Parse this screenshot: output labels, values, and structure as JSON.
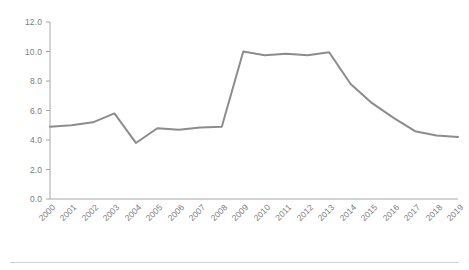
{
  "chart_data": {
    "type": "line",
    "title": "",
    "subtitle": "",
    "xlabel": "",
    "ylabel": "",
    "categories": [
      "2000",
      "2001",
      "2002",
      "2003",
      "2004",
      "2005",
      "2006",
      "2007",
      "2008",
      "2009",
      "2010",
      "2011",
      "2012",
      "2013",
      "2014",
      "2015",
      "2016",
      "2017",
      "2018",
      "2019"
    ],
    "series": [
      {
        "name": "",
        "values": [
          4.9,
          5.0,
          5.2,
          5.8,
          3.8,
          4.8,
          4.7,
          4.85,
          4.9,
          10.0,
          9.75,
          9.85,
          9.75,
          9.95,
          7.8,
          6.5,
          5.5,
          4.6,
          4.3,
          4.2
        ]
      }
    ],
    "ylim": [
      0.0,
      12.0
    ],
    "ytick_labels": [
      "0.0",
      "2.0",
      "4.0",
      "6.0",
      "8.0",
      "10.0",
      "12.0"
    ],
    "ytick_values": [
      0.0,
      2.0,
      4.0,
      6.0,
      8.0,
      10.0,
      12.0
    ],
    "grid": false,
    "legend": "none",
    "line_color": "#8c8c8c",
    "axis_color": "#a6a6a6",
    "tick_label_color": "#7c7c7c",
    "background_color": "#ffffff",
    "footer_rule_color": "#d0d0d0",
    "xtick_rotation_degrees": -45
  }
}
